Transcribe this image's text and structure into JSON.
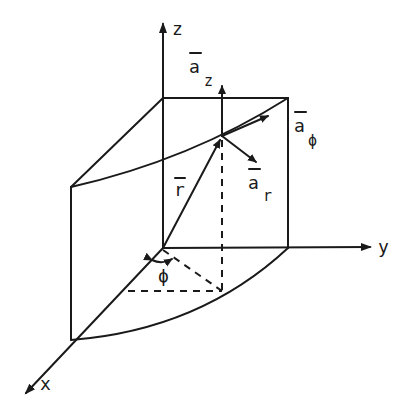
{
  "diagram": {
    "axes": {
      "x_label": "x",
      "y_label": "y",
      "z_label": "z"
    },
    "vectors": {
      "position_label": "r",
      "unit_z_label": "a",
      "unit_z_sub": "z",
      "unit_r_label": "a",
      "unit_r_sub": "r",
      "unit_phi_label": "a",
      "unit_phi_sub": "ϕ"
    },
    "angle_label": "ϕ",
    "colors": {
      "ink": "#1a1a1a",
      "background": "#ffffff"
    }
  }
}
